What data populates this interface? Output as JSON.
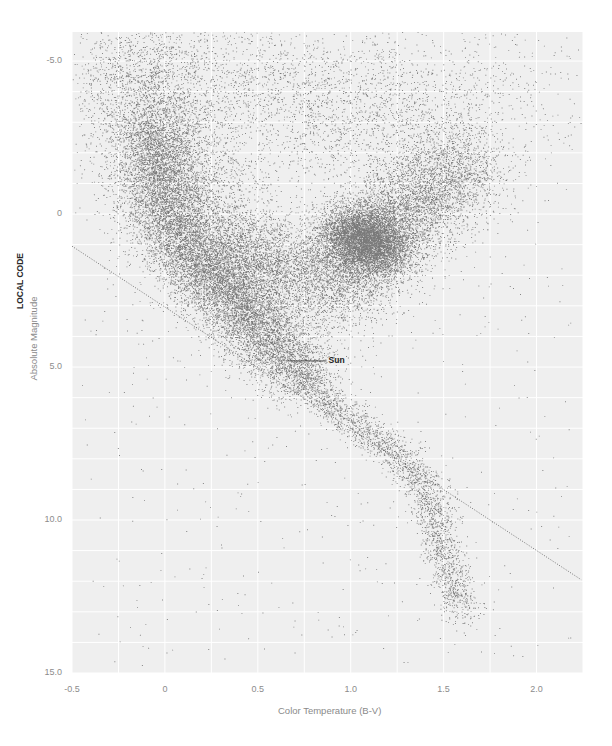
{
  "chart_data": {
    "type": "scatter",
    "title": "",
    "xlabel": "Color Temperature (B-V)",
    "ylabel": "Absolute Magnitude",
    "side_label": "LOCAL CODE",
    "xlim": [
      -0.5,
      2.25
    ],
    "ylim": [
      -5.95,
      15.0
    ],
    "y_inverted": true,
    "grid": true,
    "x_ticks": [
      {
        "value": -0.5,
        "label": "-0.5"
      },
      {
        "value": 0,
        "label": "0"
      },
      {
        "value": 0.5,
        "label": "0.5"
      },
      {
        "value": 1.0,
        "label": "1.0"
      },
      {
        "value": 1.5,
        "label": "1.5"
      },
      {
        "value": 2.0,
        "label": "2.0"
      }
    ],
    "y_ticks": [
      {
        "value": -5,
        "label": "-5.0"
      },
      {
        "value": 0,
        "label": "0"
      },
      {
        "value": 5,
        "label": "5.0"
      },
      {
        "value": 10,
        "label": "10.0"
      },
      {
        "value": 15,
        "label": "15.0"
      }
    ],
    "annotations": [
      {
        "text": "Sun",
        "x": 0.65,
        "y": 4.8,
        "line_to_x": 0.87
      }
    ],
    "reference_line": {
      "style": "dotted",
      "from": [
        -0.5,
        1.05
      ],
      "to": [
        2.24,
        11.95
      ]
    },
    "point_color": "#1a1a1a",
    "background_color": "#efefef",
    "grid_color": "#ffffff",
    "density_regions": [
      {
        "name": "upper main sequence",
        "count": 9000,
        "path": [
          [
            -0.05,
            -3.0
          ],
          [
            0.0,
            0.0
          ],
          [
            0.15,
            1.4
          ],
          [
            0.4,
            3.0
          ],
          [
            0.6,
            4.4
          ],
          [
            0.75,
            5.3
          ]
        ],
        "spread_x": 0.11,
        "spread_y": 0.55
      },
      {
        "name": "broad upper MS halo",
        "count": 6000,
        "path": [
          [
            -0.15,
            -5.5
          ],
          [
            0.0,
            -2.0
          ],
          [
            0.2,
            0.3
          ],
          [
            0.45,
            2.2
          ],
          [
            0.6,
            3.6
          ]
        ],
        "spread_x": 0.2,
        "spread_y": 0.9
      },
      {
        "name": "subgiant branch",
        "count": 2500,
        "path": [
          [
            0.3,
            1.0
          ],
          [
            0.6,
            1.8
          ],
          [
            0.9,
            1.8
          ]
        ],
        "spread_x": 0.15,
        "spread_y": 0.8
      },
      {
        "name": "red clump",
        "count": 5500,
        "path": [
          [
            0.95,
            0.6
          ],
          [
            1.1,
            0.8
          ],
          [
            1.2,
            1.2
          ]
        ],
        "spread_x": 0.09,
        "spread_y": 0.5
      },
      {
        "name": "red giant branch",
        "count": 6000,
        "path": [
          [
            0.9,
            2.5
          ],
          [
            1.1,
            1.0
          ],
          [
            1.3,
            -0.2
          ],
          [
            1.5,
            -1.0
          ],
          [
            1.65,
            -1.6
          ]
        ],
        "spread_x": 0.13,
        "spread_y": 0.9
      },
      {
        "name": "giant halo",
        "count": 3000,
        "path": [
          [
            0.3,
            -5.5
          ],
          [
            0.8,
            -3.0
          ],
          [
            1.3,
            -2.8
          ],
          [
            1.6,
            -4.5
          ]
        ],
        "spread_x": 0.35,
        "spread_y": 1.2
      },
      {
        "name": "lower main sequence",
        "count": 2600,
        "path": [
          [
            0.7,
            5.0
          ],
          [
            0.9,
            6.3
          ],
          [
            1.15,
            7.4
          ],
          [
            1.3,
            8.1
          ],
          [
            1.42,
            9.2
          ],
          [
            1.48,
            10.5
          ],
          [
            1.55,
            12.0
          ],
          [
            1.6,
            13.0
          ]
        ],
        "spread_x": 0.055,
        "spread_y": 0.3
      },
      {
        "name": "sparse field",
        "count": 700,
        "box": [
          [
            -0.45,
            -5.9
          ],
          [
            2.2,
            14.8
          ]
        ]
      }
    ]
  }
}
